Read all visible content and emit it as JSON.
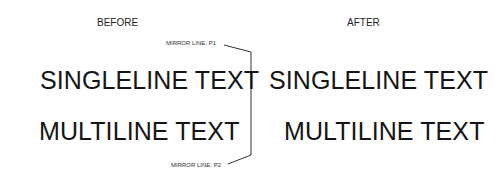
{
  "diagram": {
    "before": {
      "heading": "BEFORE",
      "singleline": "SINGLELINE TEXT",
      "multiline": "MULTILINE TEXT"
    },
    "after": {
      "heading": "AFTER",
      "singleline": "SINGLELINE TEXT",
      "multiline": "MULTILINE TEXT"
    },
    "mirror_line": {
      "p1_label": "MIRROR LINE: P1",
      "p2_label": "MIRROR LINE: P2",
      "color": "#333333"
    }
  }
}
